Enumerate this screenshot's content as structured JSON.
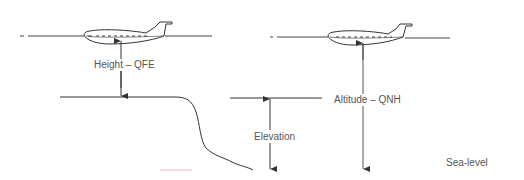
{
  "diagram": {
    "labels": {
      "height_qfe": "Height  –  QFE",
      "altitude_qnh": "Altitude  –  QNH",
      "elevation": "Elevation",
      "sea_level": "Sea-level"
    },
    "colors": {
      "line": "#333333",
      "text": "#555555",
      "background": "#ffffff"
    },
    "icons": [
      "aircraft-icon",
      "aircraft-icon"
    ]
  }
}
